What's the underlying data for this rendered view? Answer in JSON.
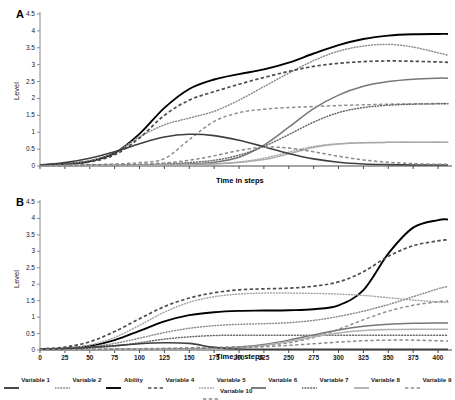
{
  "panels": {
    "a": {
      "label": "A",
      "ylabel": "Level",
      "xlabel": "Time in steps"
    },
    "b": {
      "label": "B",
      "ylabel": "Level",
      "xlabel": "Time in steps"
    }
  },
  "legend": {
    "items": [
      {
        "label": "Variable 1",
        "style": "solid",
        "color": "#3f3f3f"
      },
      {
        "label": "Variable 2",
        "style": "dotted",
        "color": "#8c8c8c"
      },
      {
        "label": "Ability",
        "style": "solid",
        "color": "#000000"
      },
      {
        "label": "Variable 4",
        "style": "dashed",
        "color": "#4d4d4d"
      },
      {
        "label": "Variable 5",
        "style": "dotted",
        "color": "#a6a6a6"
      },
      {
        "label": "Variable 6",
        "style": "solid",
        "color": "#777777"
      },
      {
        "label": "Variable 7",
        "style": "dotted",
        "color": "#666666"
      },
      {
        "label": "Variable 8",
        "style": "solid",
        "color": "#b0b0b0"
      },
      {
        "label": "Variable 9",
        "style": "dashed",
        "color": "#909090"
      },
      {
        "label": "Variable 10",
        "style": "dashed",
        "color": "#8a8a8a"
      }
    ]
  },
  "chart_data": [
    {
      "type": "line",
      "panel": "A",
      "title": "",
      "xlabel": "Time in steps",
      "ylabel": "Level",
      "xlim": [
        0,
        410
      ],
      "ylim": [
        0,
        4.5
      ],
      "yticks": [
        0,
        0.5,
        1,
        1.5,
        2,
        2.5,
        3,
        3.5,
        4,
        4.5
      ],
      "ytick_labels": [
        "0",
        "0.5",
        "1",
        "1.5",
        "2",
        "2.5",
        "3",
        "3.5",
        "4",
        "4.5"
      ],
      "xticks": [
        0,
        25,
        50,
        75,
        100,
        125,
        150,
        175,
        200,
        225,
        250,
        275,
        300,
        325,
        350,
        375,
        400
      ],
      "xtick_labels_shown": false,
      "grid": false,
      "legend_position": "bottom-shared",
      "x": [
        0,
        25,
        50,
        75,
        100,
        125,
        150,
        175,
        200,
        225,
        250,
        275,
        300,
        325,
        350,
        375,
        400,
        410
      ],
      "series": [
        {
          "name": "Ability",
          "style": "solid",
          "color": "#000000",
          "width": 1.9,
          "values": [
            0.03,
            0.06,
            0.14,
            0.38,
            0.95,
            1.72,
            2.28,
            2.56,
            2.72,
            2.86,
            3.06,
            3.33,
            3.58,
            3.76,
            3.86,
            3.9,
            3.91,
            3.91
          ]
        },
        {
          "name": "Variable 2",
          "style": "dotted",
          "color": "#8c8c8c",
          "width": 1.5,
          "values": [
            0.03,
            0.07,
            0.16,
            0.4,
            0.86,
            1.22,
            1.42,
            1.62,
            1.95,
            2.35,
            2.75,
            3.12,
            3.4,
            3.55,
            3.6,
            3.52,
            3.35,
            3.28
          ]
        },
        {
          "name": "Variable 4",
          "style": "dashed",
          "color": "#4d4d4d",
          "width": 1.7,
          "values": [
            0.02,
            0.05,
            0.12,
            0.33,
            0.83,
            1.5,
            1.95,
            2.2,
            2.42,
            2.62,
            2.8,
            2.95,
            3.04,
            3.09,
            3.11,
            3.1,
            3.08,
            3.07
          ]
        },
        {
          "name": "Variable 6",
          "style": "solid",
          "color": "#777777",
          "width": 1.5,
          "values": [
            0.01,
            0.01,
            0.02,
            0.02,
            0.03,
            0.04,
            0.06,
            0.11,
            0.26,
            0.62,
            1.15,
            1.7,
            2.1,
            2.36,
            2.5,
            2.57,
            2.6,
            2.6
          ]
        },
        {
          "name": "Variable 9",
          "style": "dashed",
          "color": "#909090",
          "width": 1.5,
          "values": [
            0.02,
            0.03,
            0.04,
            0.06,
            0.1,
            0.22,
            0.78,
            1.32,
            1.58,
            1.68,
            1.73,
            1.76,
            1.79,
            1.81,
            1.83,
            1.84,
            1.85,
            1.85
          ]
        },
        {
          "name": "Variable 7",
          "style": "dotted",
          "color": "#666666",
          "width": 1.5,
          "values": [
            0.01,
            0.01,
            0.02,
            0.03,
            0.04,
            0.06,
            0.1,
            0.17,
            0.32,
            0.58,
            0.93,
            1.3,
            1.58,
            1.73,
            1.8,
            1.83,
            1.84,
            1.84
          ]
        },
        {
          "name": "Variable 8",
          "style": "solid",
          "color": "#b0b0b0",
          "width": 1.5,
          "values": [
            0.01,
            0.01,
            0.01,
            0.02,
            0.02,
            0.03,
            0.04,
            0.06,
            0.1,
            0.19,
            0.36,
            0.55,
            0.65,
            0.69,
            0.7,
            0.7,
            0.7,
            0.7
          ]
        },
        {
          "name": "Variable 5",
          "style": "dotted",
          "color": "#a6a6a6",
          "width": 1.5,
          "values": [
            0.01,
            0.01,
            0.01,
            0.02,
            0.02,
            0.03,
            0.04,
            0.07,
            0.12,
            0.23,
            0.41,
            0.58,
            0.66,
            0.69,
            0.7,
            0.7,
            0.7,
            0.7
          ]
        },
        {
          "name": "Variable 1",
          "style": "solid",
          "color": "#3f3f3f",
          "width": 1.6,
          "values": [
            0.03,
            0.1,
            0.23,
            0.42,
            0.66,
            0.86,
            0.94,
            0.9,
            0.76,
            0.57,
            0.37,
            0.21,
            0.11,
            0.06,
            0.04,
            0.03,
            0.03,
            0.03
          ]
        },
        {
          "name": "Variable 10",
          "style": "dashed",
          "color": "#8a8a8a",
          "width": 1.5,
          "values": [
            0.01,
            0.01,
            0.02,
            0.03,
            0.05,
            0.09,
            0.17,
            0.3,
            0.46,
            0.56,
            0.53,
            0.42,
            0.29,
            0.18,
            0.11,
            0.07,
            0.05,
            0.05
          ]
        }
      ]
    },
    {
      "type": "line",
      "panel": "B",
      "title": "",
      "xlabel": "Time in steps",
      "ylabel": "Level",
      "xlim": [
        0,
        410
      ],
      "ylim": [
        0,
        4.5
      ],
      "yticks": [
        0,
        0.5,
        1,
        1.5,
        2,
        2.5,
        3,
        3.5,
        4,
        4.5
      ],
      "ytick_labels": [
        "0",
        "0.5",
        "1",
        "1.5",
        "2",
        "2.5",
        "3",
        "3.5",
        "4",
        "4.5"
      ],
      "xticks": [
        0,
        25,
        50,
        75,
        100,
        125,
        150,
        175,
        200,
        225,
        250,
        275,
        300,
        325,
        350,
        375,
        400
      ],
      "xtick_labels": [
        "0",
        "25",
        "50",
        "75",
        "100",
        "125",
        "150",
        "175",
        "200",
        "225",
        "250",
        "275",
        "300",
        "325",
        "350",
        "375",
        "400"
      ],
      "xtick_labels_shown": true,
      "grid": false,
      "legend_position": "bottom-shared",
      "x": [
        0,
        25,
        50,
        75,
        100,
        125,
        150,
        175,
        200,
        225,
        250,
        275,
        300,
        325,
        350,
        375,
        400,
        410
      ],
      "series": [
        {
          "name": "Ability",
          "style": "solid",
          "color": "#000000",
          "width": 1.9,
          "values": [
            0.03,
            0.05,
            0.12,
            0.3,
            0.58,
            0.87,
            1.06,
            1.15,
            1.19,
            1.2,
            1.21,
            1.24,
            1.36,
            1.82,
            2.93,
            3.72,
            3.95,
            3.97
          ]
        },
        {
          "name": "Variable 4",
          "style": "dashed",
          "color": "#4d4d4d",
          "width": 1.7,
          "values": [
            0.03,
            0.09,
            0.25,
            0.56,
            0.95,
            1.32,
            1.58,
            1.74,
            1.83,
            1.86,
            1.88,
            1.94,
            2.07,
            2.38,
            2.85,
            3.17,
            3.32,
            3.35
          ]
        },
        {
          "name": "Variable 5",
          "style": "dotted",
          "color": "#a6a6a6",
          "width": 1.5,
          "values": [
            0.02,
            0.05,
            0.15,
            0.38,
            0.75,
            1.15,
            1.45,
            1.62,
            1.7,
            1.73,
            1.73,
            1.72,
            1.7,
            1.66,
            1.59,
            1.52,
            1.46,
            1.45
          ]
        },
        {
          "name": "Variable 2",
          "style": "dotted",
          "color": "#8c8c8c",
          "width": 1.5,
          "values": [
            0.02,
            0.04,
            0.09,
            0.2,
            0.36,
            0.53,
            0.66,
            0.74,
            0.78,
            0.8,
            0.83,
            0.9,
            1.02,
            1.18,
            1.38,
            1.62,
            1.86,
            1.93
          ]
        },
        {
          "name": "Variable 7",
          "style": "dotted",
          "color": "#666666",
          "width": 1.5,
          "values": [
            0.02,
            0.03,
            0.06,
            0.12,
            0.22,
            0.33,
            0.4,
            0.44,
            0.45,
            0.45,
            0.45,
            0.45,
            0.45,
            0.45,
            0.45,
            0.45,
            0.45,
            0.45
          ]
        },
        {
          "name": "Variable 9",
          "style": "dashed",
          "color": "#909090",
          "width": 1.5,
          "values": [
            0.01,
            0.01,
            0.02,
            0.03,
            0.04,
            0.05,
            0.07,
            0.08,
            0.1,
            0.14,
            0.22,
            0.38,
            0.63,
            0.92,
            1.18,
            1.36,
            1.47,
            1.49
          ]
        },
        {
          "name": "Variable 6",
          "style": "solid",
          "color": "#777777",
          "width": 1.5,
          "values": [
            0.01,
            0.01,
            0.01,
            0.02,
            0.02,
            0.03,
            0.04,
            0.05,
            0.09,
            0.17,
            0.3,
            0.46,
            0.61,
            0.72,
            0.78,
            0.81,
            0.82,
            0.82
          ]
        },
        {
          "name": "Variable 8",
          "style": "solid",
          "color": "#b0b0b0",
          "width": 1.5,
          "values": [
            0.01,
            0.01,
            0.01,
            0.01,
            0.02,
            0.02,
            0.03,
            0.04,
            0.07,
            0.14,
            0.26,
            0.4,
            0.52,
            0.59,
            0.62,
            0.63,
            0.63,
            0.63
          ]
        },
        {
          "name": "Variable 1",
          "style": "solid",
          "color": "#3f3f3f",
          "width": 1.6,
          "values": [
            0.02,
            0.04,
            0.08,
            0.13,
            0.19,
            0.22,
            0.2,
            0.08,
            0.03,
            0.02,
            0.02,
            0.02,
            0.02,
            0.02,
            0.02,
            0.02,
            0.02,
            0.02
          ]
        },
        {
          "name": "Variable 10",
          "style": "dashed",
          "color": "#8a8a8a",
          "width": 1.5,
          "values": [
            0.01,
            0.01,
            0.01,
            0.02,
            0.02,
            0.03,
            0.04,
            0.05,
            0.07,
            0.1,
            0.14,
            0.19,
            0.24,
            0.28,
            0.3,
            0.3,
            0.28,
            0.27
          ]
        }
      ]
    }
  ]
}
